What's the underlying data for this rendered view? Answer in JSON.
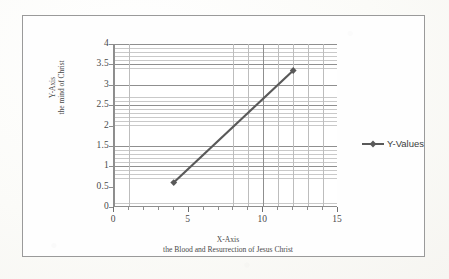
{
  "chart_data": {
    "type": "line",
    "title": "",
    "series": [
      {
        "name": "Y-Values",
        "color": "#595959",
        "marker": "diamond",
        "points": [
          {
            "x": 4,
            "y": 0.6
          },
          {
            "x": 12,
            "y": 3.35
          }
        ]
      }
    ],
    "xlabel": "X-Axis",
    "xlabel_sub": "the Blood and Resurrection of Jesus Christ",
    "ylabel": "Y-Axis",
    "ylabel_sub": "the mind of Christ",
    "xlim": [
      0,
      15
    ],
    "ylim": [
      0,
      4
    ],
    "x_ticks": [
      0,
      5,
      10,
      15
    ],
    "x_tick_labels": [
      "0",
      "5",
      "10",
      "15"
    ],
    "x_minor_step": 1,
    "y_ticks": [
      0,
      0.5,
      1,
      1.5,
      2,
      2.5,
      3,
      3.5,
      4
    ],
    "y_tick_labels": [
      "0",
      "0.5",
      "1",
      "1.5",
      "2",
      "2.5",
      "3",
      "3.5",
      "4"
    ],
    "y_minor_step": 0.1,
    "grid": true,
    "legend_position": "right",
    "legend_entries": [
      "Y-Values"
    ],
    "plot_background": "#ffffff",
    "grid_color": "#c9c9c9",
    "axis_color": "#8d8d8d",
    "frame_color": "#9a9a9a"
  },
  "axes": {
    "y_title_line1": "Y-Axis",
    "y_title_line2": "the mind of Christ",
    "x_title_line1": "X-Axis",
    "x_title_line2": "the Blood and Resurrection of Jesus Christ"
  },
  "legend": {
    "label": "Y-Values"
  }
}
